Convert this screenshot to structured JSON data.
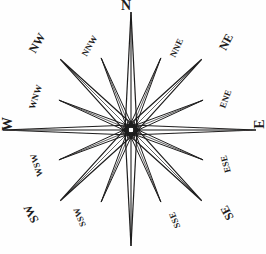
{
  "figure": {
    "name": "compass-rose",
    "ink_color": "#1d1c1c",
    "background_color": "#ffffff",
    "center": {
      "x": 131,
      "y": 130
    },
    "hub_gap_radius": 9
  },
  "chart_data": {
    "type": "scatter",
    "xlabel": "",
    "ylabel": "",
    "categories": [
      "N",
      "NNE",
      "NE",
      "ENE",
      "E",
      "ESE",
      "SE",
      "SSE",
      "S",
      "SSW",
      "SW",
      "WSW",
      "W",
      "WNW",
      "NW",
      "NNW"
    ],
    "values": [
      118,
      78,
      100,
      78,
      125,
      78,
      100,
      78,
      116,
      78,
      100,
      78,
      128,
      78,
      100,
      78
    ],
    "series": [
      {
        "name": "ray_length_px",
        "values": [
          118,
          78,
          100,
          78,
          125,
          78,
          100,
          78,
          116,
          78,
          100,
          78,
          128,
          78,
          100,
          78
        ]
      },
      {
        "name": "bearing_degrees",
        "values": [
          0,
          22.5,
          45,
          67.5,
          90,
          112.5,
          135,
          157.5,
          180,
          202.5,
          225,
          247.5,
          270,
          292.5,
          315,
          337.5
        ]
      },
      {
        "name": "ray_half_width_px",
        "values": [
          6,
          3,
          5,
          3,
          5,
          3,
          5,
          3,
          6,
          3,
          5,
          3,
          5,
          3,
          5,
          3
        ]
      }
    ],
    "legend_position": "none",
    "grid": false
  },
  "points": [
    {
      "key": "n",
      "label": "N",
      "bearing": 0,
      "tier": "cardinal",
      "ray_length": 118,
      "half_width": 6,
      "label_left": 126,
      "label_top": 6,
      "rotation": 0,
      "label_visible": true
    },
    {
      "key": "nne",
      "label": "NNE",
      "bearing": 22.5,
      "tier": "minor",
      "ray_length": 78,
      "half_width": 3,
      "label_left": 177,
      "label_top": 48,
      "rotation": -64,
      "label_visible": true
    },
    {
      "key": "ne",
      "label": "NE",
      "bearing": 45,
      "tier": "ordinal",
      "ray_length": 100,
      "half_width": 5,
      "label_left": 226,
      "label_top": 42,
      "rotation": -63,
      "label_visible": true
    },
    {
      "key": "ene",
      "label": "ENE",
      "bearing": 67.5,
      "tier": "minor",
      "ray_length": 78,
      "half_width": 3,
      "label_left": 226,
      "label_top": 99,
      "rotation": -70,
      "label_visible": true
    },
    {
      "key": "e",
      "label": "E",
      "bearing": 90,
      "tier": "cardinal",
      "ray_length": 125,
      "half_width": 5,
      "label_left": 260,
      "label_top": 124,
      "rotation": -90,
      "label_visible": true
    },
    {
      "key": "ese",
      "label": "ESE",
      "bearing": 112.5,
      "tier": "minor",
      "ray_length": 78,
      "half_width": 3,
      "label_left": 226,
      "label_top": 164,
      "rotation": -105,
      "label_visible": true
    },
    {
      "key": "se",
      "label": "SE",
      "bearing": 135,
      "tier": "ordinal",
      "ray_length": 100,
      "half_width": 5,
      "label_left": 227,
      "label_top": 213,
      "rotation": -118,
      "label_visible": true
    },
    {
      "key": "sse",
      "label": "SSE",
      "bearing": 157.5,
      "tier": "minor",
      "ray_length": 78,
      "half_width": 3,
      "label_left": 175,
      "label_top": 220,
      "rotation": -112,
      "label_visible": true
    },
    {
      "key": "s",
      "label": "S",
      "bearing": 180,
      "tier": "cardinal",
      "ray_length": 116,
      "half_width": 6,
      "label_left": 128,
      "label_top": 243,
      "rotation": 0,
      "label_visible": false
    },
    {
      "key": "ssw",
      "label": "SSW",
      "bearing": 202.5,
      "tier": "minor",
      "ray_length": 78,
      "half_width": 3,
      "label_left": 80,
      "label_top": 217,
      "rotation": -112,
      "label_visible": true
    },
    {
      "key": "sw",
      "label": "SW",
      "bearing": 225,
      "tier": "ordinal",
      "ray_length": 100,
      "half_width": 5,
      "label_left": 31,
      "label_top": 214,
      "rotation": -118,
      "label_visible": true
    },
    {
      "key": "wsw",
      "label": "WSW",
      "bearing": 247.5,
      "tier": "minor",
      "ray_length": 78,
      "half_width": 3,
      "label_left": 37,
      "label_top": 165,
      "rotation": -108,
      "label_visible": true
    },
    {
      "key": "w",
      "label": "W",
      "bearing": 270,
      "tier": "cardinal",
      "ray_length": 128,
      "half_width": 5,
      "label_left": 8,
      "label_top": 124,
      "rotation": -90,
      "label_visible": true
    },
    {
      "key": "wnw",
      "label": "WNW",
      "bearing": 292.5,
      "tier": "minor",
      "ray_length": 78,
      "half_width": 3,
      "label_left": 36,
      "label_top": 97,
      "rotation": -72,
      "label_visible": true
    },
    {
      "key": "nw",
      "label": "NW",
      "bearing": 315,
      "tier": "ordinal",
      "ray_length": 100,
      "half_width": 5,
      "label_left": 37,
      "label_top": 43,
      "rotation": -60,
      "label_visible": true
    },
    {
      "key": "nnw",
      "label": "NNW",
      "bearing": 337.5,
      "tier": "minor",
      "ray_length": 78,
      "half_width": 3,
      "label_left": 90,
      "label_top": 46,
      "rotation": -60,
      "label_visible": true
    }
  ]
}
